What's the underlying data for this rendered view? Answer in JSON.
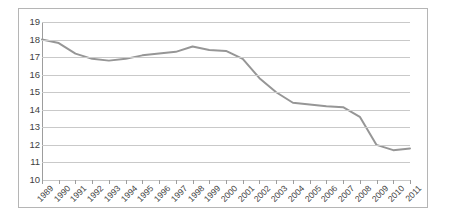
{
  "chart_data": {
    "type": "line",
    "title": "",
    "subtitle": "",
    "xlabel": "",
    "ylabel": "",
    "categories": [
      "1989",
      "1990",
      "1991",
      "1992",
      "1993",
      "1994",
      "1995",
      "1996",
      "1997",
      "1998",
      "1999",
      "2000",
      "2001",
      "2002",
      "2003",
      "2004",
      "2005",
      "2006",
      "2007",
      "2008",
      "2009",
      "2010",
      "2011"
    ],
    "values": [
      18.0,
      17.8,
      17.2,
      16.9,
      16.8,
      16.9,
      17.1,
      17.2,
      17.3,
      17.6,
      17.4,
      17.35,
      16.9,
      15.8,
      15.0,
      14.4,
      14.3,
      14.2,
      14.15,
      13.6,
      12.0,
      11.7,
      11.8
    ],
    "series": [
      {
        "name": "series-1",
        "color": "#969696",
        "values": [
          18.0,
          17.8,
          17.2,
          16.9,
          16.8,
          16.9,
          17.1,
          17.2,
          17.3,
          17.6,
          17.4,
          17.35,
          16.9,
          15.8,
          15.0,
          14.4,
          14.3,
          14.2,
          14.15,
          13.6,
          12.0,
          11.7,
          11.8
        ]
      }
    ],
    "ylim": [
      10,
      19
    ],
    "yticks": [
      19,
      18,
      17,
      16,
      15,
      14,
      13,
      12,
      11,
      10
    ],
    "ytick_labels": [
      "19",
      "18",
      "17",
      "16",
      "15",
      "14",
      "13",
      "12",
      "11",
      "10"
    ],
    "grid": true,
    "grid_axis": "y",
    "legend": false,
    "legend_position": "none",
    "markers": false,
    "line_width": 2,
    "xtick_rotation": -45
  },
  "style": {
    "line_color": "#969696",
    "grid_color": "#c9c9c9",
    "axis_color": "#9d9d9d",
    "border_color": "#b5b5b5",
    "text_color": "#3f3f3f",
    "background": "#ffffff"
  }
}
